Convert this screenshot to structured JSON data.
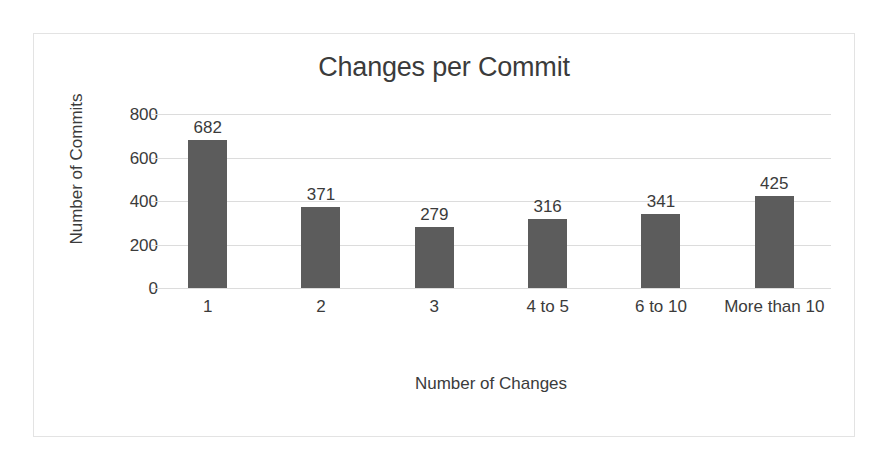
{
  "chart_data": {
    "type": "bar",
    "title": "Changes per Commit",
    "xlabel": "Number of Changes",
    "ylabel": "Number of Commits",
    "categories": [
      "1",
      "2",
      "3",
      "4 to 5",
      "6 to 10",
      "More than 10"
    ],
    "values": [
      682,
      371,
      279,
      316,
      341,
      425
    ],
    "data_labels": [
      "682",
      "371",
      "279",
      "316",
      "341",
      "425"
    ],
    "ylim": [
      0,
      800
    ],
    "yticks": [
      0,
      200,
      400,
      600,
      800
    ],
    "ytick_labels": [
      "0",
      "200",
      "400",
      "600",
      "800"
    ],
    "grid": true,
    "grid_axis": "y",
    "legend": false,
    "legend_position": "none",
    "series": [
      {
        "name": "Number of Commits",
        "values": [
          682,
          371,
          279,
          316,
          341,
          425
        ]
      }
    ]
  },
  "colors": {
    "bar": "#5c5c5c",
    "gridline": "#dcdcdc",
    "border": "#e3e3e3",
    "text": "#3b3b3b",
    "background": "#ffffff"
  }
}
